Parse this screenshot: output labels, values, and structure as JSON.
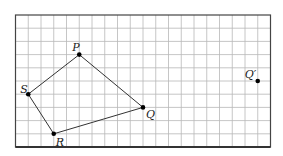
{
  "diagram": {
    "type": "grid-polygon-translation",
    "grid": {
      "columns": 20,
      "rows": 10,
      "origin_px": [
        15.5,
        15
      ],
      "cell_px": [
        12.75,
        13.2
      ],
      "line_color": "#b8b8b8",
      "border_color": "#444444"
    },
    "polygon": {
      "name": "PQRS",
      "order": [
        "P",
        "Q",
        "R",
        "S"
      ],
      "edge_color": "#333333"
    },
    "points": [
      {
        "id": "P",
        "label": "P",
        "col": 5,
        "row": 3,
        "label_dx": -7,
        "label_dy": -4
      },
      {
        "id": "Q",
        "label": "Q",
        "col": 10,
        "row": 7,
        "label_dx": 3,
        "label_dy": 11
      },
      {
        "id": "R",
        "label": "R",
        "col": 3,
        "row": 9,
        "label_dx": 2,
        "label_dy": 12
      },
      {
        "id": "S",
        "label": "S",
        "col": 1,
        "row": 6,
        "label_dx": -8,
        "label_dy": -1
      },
      {
        "id": "Qprime",
        "label": "Q′",
        "col": 19,
        "row": 5,
        "label_dx": -13,
        "label_dy": -3
      }
    ]
  }
}
